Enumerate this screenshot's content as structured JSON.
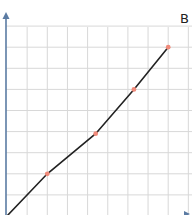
{
  "chart_data": {
    "type": "line",
    "title": "",
    "panel_label": "B",
    "xlabel": "",
    "ylabel": "",
    "grid": true,
    "legend": null,
    "x": [
      0,
      2,
      4.4,
      6.3,
      8
    ],
    "values": [
      0,
      2,
      3.9,
      6,
      8
    ],
    "xlim": [
      0,
      9
    ],
    "ylim": [
      0,
      9.5
    ],
    "marker_color": "#f08a7a",
    "line_color": "#222222",
    "axis_color": "#5b7ba3",
    "grid_color": "#d8d8d8"
  },
  "panel": {
    "label": "B"
  }
}
